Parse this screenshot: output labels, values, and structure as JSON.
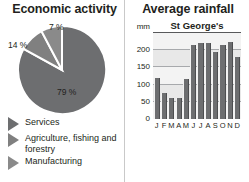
{
  "pie_panel": {
    "title": "Economic activity",
    "legend": [
      {
        "label": "Services",
        "color": "#6d6e70"
      },
      {
        "label": "Agriculture, fishing and forestry",
        "color": "#808080"
      },
      {
        "label": "Manufacturing",
        "color": "#8a8a8a"
      }
    ]
  },
  "bar_panel": {
    "title": "Average rainfall",
    "series_label": "St George's",
    "y_unit": "mm"
  },
  "chart_data": [
    {
      "type": "pie",
      "title": "Economic activity",
      "labels": [
        "Services",
        "Agriculture, fishing and forestry",
        "Manufacturing"
      ],
      "values": [
        79,
        14,
        7
      ],
      "data_labels": [
        "79 %",
        "14 %",
        "7 %"
      ],
      "unit": "%",
      "legend_position": "bottom",
      "colors": [
        "#6d6e70",
        "#808080",
        "#8a8a8a"
      ]
    },
    {
      "type": "bar",
      "title": "Average rainfall",
      "series_name": "St George's",
      "categories": [
        "J",
        "F",
        "M",
        "A",
        "M",
        "J",
        "J",
        "A",
        "S",
        "O",
        "N",
        "D"
      ],
      "values": [
        120,
        75,
        60,
        62,
        115,
        215,
        222,
        220,
        195,
        215,
        225,
        180
      ],
      "xlabel": "",
      "ylabel": "mm",
      "ylim": [
        0,
        250
      ],
      "yticks": [
        0,
        50,
        100,
        150,
        200
      ],
      "ytick_labels": [
        "0",
        "50",
        "100",
        "150",
        "200"
      ],
      "grid": true,
      "bar_color": "#6d6e70"
    }
  ]
}
